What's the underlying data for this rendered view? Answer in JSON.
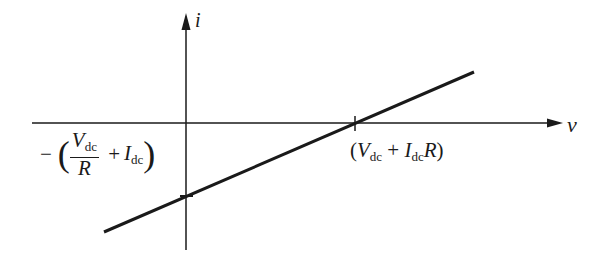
{
  "diagram": {
    "type": "i-v characteristic line",
    "axes": {
      "x_label": "v",
      "y_label": "i"
    },
    "x_intercept_label": {
      "open": "(",
      "V": "V",
      "V_sub": "dc",
      "plus": "+",
      "I": "I",
      "I_sub": "dc",
      "R": "R",
      "close": ")"
    },
    "y_intercept_label": {
      "minus": "−",
      "open": "(",
      "V": "V",
      "V_sub": "dc",
      "R": "R",
      "plus": "+",
      "I": "I",
      "I_sub": "dc",
      "close": ")"
    },
    "colors": {
      "ink": "#1a1a1a",
      "background": "#ffffff"
    }
  }
}
